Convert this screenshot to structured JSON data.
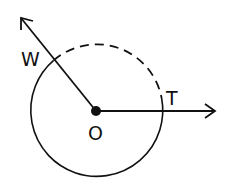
{
  "diagram": {
    "type": "geometry-circle-rays",
    "center_label": "O",
    "point_labels": [
      "W",
      "T"
    ],
    "colors": {
      "stroke": "#111111",
      "background": "#ffffff"
    },
    "labels": {
      "W": "W",
      "T": "T",
      "O": "O"
    }
  }
}
